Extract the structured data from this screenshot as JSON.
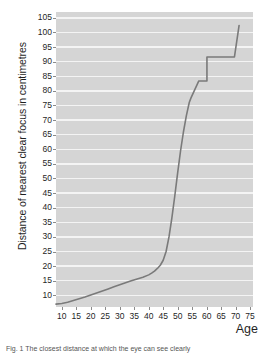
{
  "figure": {
    "caption": "Fig. 1 The closest distance at which the eye can see clearly",
    "caption_prefix": "Fig. 1"
  },
  "chart_data": {
    "type": "line",
    "title": "",
    "subtitle": "",
    "xlabel": "Age",
    "ylabel": "Distance of nearest clear focus in centimetres",
    "xlim": [
      8,
      76
    ],
    "ylim": [
      6,
      107
    ],
    "xticks": [
      10,
      15,
      20,
      25,
      30,
      35,
      40,
      45,
      50,
      55,
      60,
      65,
      70,
      75
    ],
    "yticks": [
      10,
      15,
      20,
      25,
      30,
      35,
      40,
      45,
      50,
      55,
      60,
      65,
      70,
      75,
      80,
      85,
      90,
      95,
      100,
      105
    ],
    "grid": "horizontal",
    "grid_color": "#f4f4f4",
    "plot_background": "#d5d5d5",
    "line_color": "#7a7a7a",
    "line_width": 1.6,
    "legend": "none",
    "series": [
      {
        "name": "Nearest clear focus distance",
        "x": [
          8,
          10,
          12,
          14,
          16,
          18,
          20,
          22,
          24,
          26,
          28,
          30,
          32,
          34,
          36,
          38,
          40,
          41,
          42,
          43,
          44,
          45,
          46,
          47,
          48,
          49,
          50,
          51,
          52,
          53,
          54,
          54.6,
          54.6,
          57.3,
          57.3,
          60.1,
          60.1,
          63.2,
          63.2,
          69.6,
          69.6,
          71.2
        ],
        "y": [
          7,
          7.2,
          7.6,
          8.2,
          8.8,
          9.4,
          10.1,
          10.8,
          11.5,
          12.2,
          12.9,
          13.6,
          14.3,
          15.0,
          15.6,
          16.2,
          17.0,
          17.6,
          18.3,
          19.2,
          20.3,
          22.0,
          25.0,
          30.0,
          36.5,
          44.0,
          52.0,
          59.5,
          66.0,
          71.5,
          76.0,
          77.6,
          77.6,
          83.4,
          83.4,
          83.4,
          91.6,
          91.6,
          91.6,
          91.6,
          91.6,
          102.4
        ]
      }
    ]
  }
}
